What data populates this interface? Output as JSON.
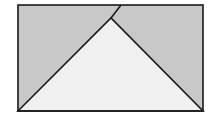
{
  "diagram": {
    "colors": {
      "background": "#ffffff",
      "shaded": "#c8c8c8",
      "triangle_fill": "#f0f0f0",
      "stroke": "#1a1a1a"
    },
    "rectangle": {
      "x": 18,
      "y": 5,
      "width": 185,
      "height": 106
    },
    "triangle": {
      "apex": [
        111,
        18
      ],
      "base_left": [
        18,
        111
      ],
      "base_right": [
        203,
        111
      ]
    },
    "apex_line": {
      "from": [
        111,
        18
      ],
      "to": [
        121,
        5
      ]
    }
  }
}
